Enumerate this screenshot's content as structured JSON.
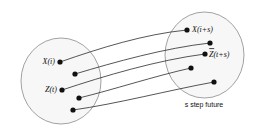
{
  "diagram": {
    "colors": {
      "ellipse_fill": "#f7f7f7",
      "ellipse_stroke": "#8a8a8a",
      "curve_stroke": "#2b2b2b",
      "dot_fill": "#111111",
      "background": "#ffffff",
      "text": "#111111"
    },
    "sets": [
      {
        "id": "source-set",
        "name": "present-state-set",
        "cx": 61,
        "cy": 81,
        "rx": 40,
        "ry": 43
      },
      {
        "id": "target-set",
        "name": "future-state-set",
        "cx": 204.5,
        "cy": 55,
        "rx": 39.5,
        "ry": 43,
        "caption": "s step future"
      }
    ],
    "source_points": [
      {
        "id": "src-1",
        "label": "X(i)",
        "x": 60,
        "y": 62,
        "has_overline": false,
        "label_anchor": "end",
        "label_x": 55,
        "label_y": 64
      },
      {
        "id": "src-2",
        "label": "",
        "x": 75,
        "y": 74,
        "has_overline": false
      },
      {
        "id": "src-3",
        "label": "Z(t)",
        "x": 62,
        "y": 90,
        "has_overline": false,
        "label_anchor": "end",
        "label_x": 57,
        "label_y": 92
      },
      {
        "id": "src-4",
        "label": "",
        "x": 79,
        "y": 98,
        "has_overline": false
      },
      {
        "id": "src-5",
        "label": "",
        "x": 73,
        "y": 110,
        "has_overline": false
      }
    ],
    "target_points": [
      {
        "id": "tgt-1",
        "label": "X(i+s)",
        "x": 187,
        "y": 30,
        "has_overline": false,
        "label_anchor": "start",
        "label_x": 192,
        "label_y": 32
      },
      {
        "id": "tgt-2",
        "label": "",
        "x": 210,
        "y": 43,
        "has_overline": false
      },
      {
        "id": "tgt-3",
        "label": "Z(t+s)",
        "x": 205,
        "y": 54,
        "has_overline": true,
        "label_anchor": "start",
        "label_x": 209,
        "label_y": 57
      },
      {
        "id": "tgt-4",
        "label": "",
        "x": 191,
        "y": 68,
        "has_overline": false
      },
      {
        "id": "tgt-5",
        "label": "",
        "x": 214,
        "y": 82,
        "has_overline": false
      }
    ],
    "curves": [
      {
        "id": "curve-1",
        "from": "src-1",
        "to": "tgt-1",
        "path": "M 60 62 C 100 48, 145 34, 187 30"
      },
      {
        "id": "curve-2",
        "from": "src-2",
        "to": "tgt-2",
        "path": "M 75 74 C 115 62, 165 48, 210 43"
      },
      {
        "id": "curve-3",
        "from": "src-3",
        "to": "tgt-3",
        "path": "M 62 90 C 104 76, 158 60, 205 54"
      },
      {
        "id": "curve-4",
        "from": "src-4",
        "to": "tgt-4",
        "path": "M 79 98 C 112 90, 155 76, 191 68"
      },
      {
        "id": "curve-5",
        "from": "src-5",
        "to": "tgt-5",
        "path": "M 73 110 C 116 104, 170 90, 214 82"
      }
    ],
    "caption": {
      "text": "s step future",
      "x": 204,
      "y": 107
    },
    "dot_radius": 2.6
  }
}
